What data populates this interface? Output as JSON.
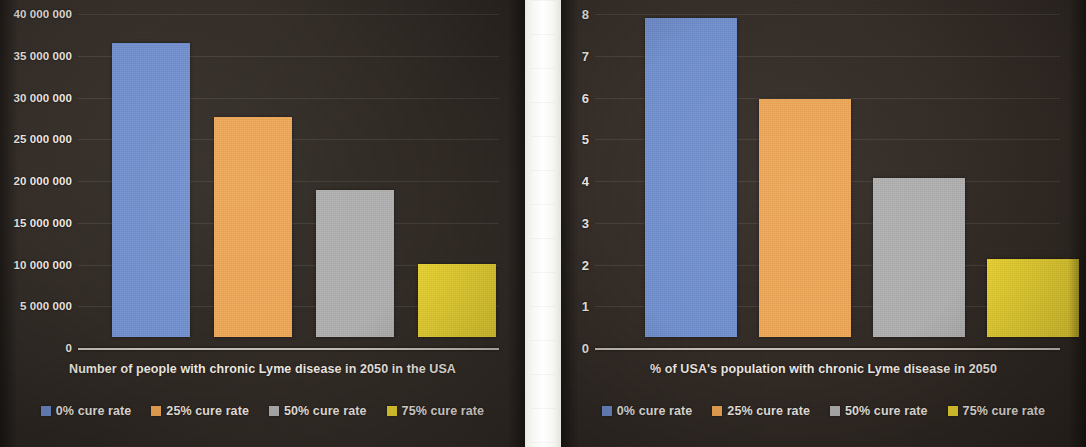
{
  "colors": {
    "series_0": "#7190d0",
    "series_25": "#f0a755",
    "series_50": "#b0b0b0",
    "series_75": "#ead32f",
    "panel_background": "#332b26",
    "text": "#efe9e2",
    "gutter": "#ffffff"
  },
  "legend": {
    "items": [
      {
        "label": "0% cure rate",
        "color": "#7190d0"
      },
      {
        "label": "25% cure rate",
        "color": "#f0a755"
      },
      {
        "label": "50% cure rate",
        "color": "#b0b0b0"
      },
      {
        "label": "75% cure rate",
        "color": "#ead32f"
      }
    ]
  },
  "chart_data": [
    {
      "id": "chart-people",
      "type": "bar",
      "title": "",
      "xlabel": "Number of people with chronic Lyme disease in 2050 in the USA",
      "ylabel": "",
      "categories": [
        "0% cure rate",
        "25% cure rate",
        "50% cure rate",
        "75% cure rate"
      ],
      "values": [
        35200000,
        26300000,
        17600000,
        8700000
      ],
      "colors": [
        "#7190d0",
        "#f0a755",
        "#b0b0b0",
        "#ead32f"
      ],
      "ylim": [
        0,
        40000000
      ],
      "ytick_values": [
        0,
        5000000,
        10000000,
        15000000,
        20000000,
        25000000,
        30000000,
        35000000,
        40000000
      ],
      "ytick_labels": [
        "0",
        "5 000 000",
        "10 000 000",
        "15 000 000",
        "20 000 000",
        "25 000 000",
        "30 000 000",
        "35 000 000",
        "40 000 000"
      ],
      "grid": true,
      "legend_position": "bottom"
    },
    {
      "id": "chart-percent",
      "type": "bar",
      "title": "",
      "xlabel": "% of USA's population with chronic Lyme disease in 2050",
      "ylabel": "",
      "categories": [
        "0% cure rate",
        "25% cure rate",
        "50% cure rate",
        "75% cure rate"
      ],
      "values": [
        7.65,
        5.7,
        3.82,
        1.88
      ],
      "colors": [
        "#7190d0",
        "#f0a755",
        "#b0b0b0",
        "#ead32f"
      ],
      "ylim": [
        0,
        8
      ],
      "ytick_values": [
        0,
        1,
        2,
        3,
        4,
        5,
        6,
        7,
        8
      ],
      "ytick_labels": [
        "0",
        "1",
        "2",
        "3",
        "4",
        "5",
        "6",
        "7",
        "8"
      ],
      "grid": true,
      "legend_position": "bottom"
    }
  ]
}
